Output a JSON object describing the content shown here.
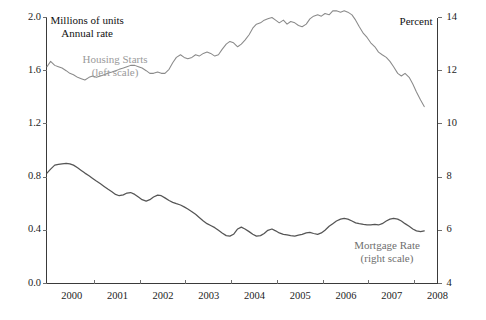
{
  "figure": {
    "background": "#ffffff",
    "left_unit_line1": "Millions of units",
    "left_unit_line2": "Annual rate",
    "right_unit": "Percent"
  },
  "annotations": {
    "housing_label_line1": "Housing Starts",
    "housing_label_line2": "(left scale)",
    "mortgage_label_line1": "Mortgage Rate",
    "mortgage_label_line2": "(right scale)"
  },
  "axes": {
    "left_ticks": [
      "0.0",
      "0.4",
      "0.8",
      "1.2",
      "1.6",
      "2.0"
    ],
    "left_tick_values": [
      0.0,
      0.4,
      0.8,
      1.2,
      1.6,
      2.0
    ],
    "right_ticks": [
      "4",
      "6",
      "8",
      "10",
      "12",
      "14"
    ],
    "right_tick_values": [
      4,
      6,
      8,
      10,
      12,
      14
    ],
    "x_ticks": [
      "2000",
      "2001",
      "2002",
      "2003",
      "2004",
      "2005",
      "2006",
      "2007",
      "2008"
    ],
    "x_tick_values": [
      2000,
      2001,
      2002,
      2003,
      2004,
      2005,
      2006,
      2007,
      2008
    ]
  },
  "chart_data": {
    "type": "line",
    "title": "",
    "subtitle": "",
    "xlabel": "",
    "ylabel": "Millions of units, Annual rate",
    "y2label": "Percent",
    "xlim": [
      1999.45,
      2008.0
    ],
    "ylim": [
      0.0,
      2.0
    ],
    "y2lim": [
      4,
      14
    ],
    "grid": false,
    "legend": "inline-annotations",
    "x_tick_labels": [
      "2000",
      "2001",
      "2002",
      "2003",
      "2004",
      "2005",
      "2006",
      "2007",
      "2008"
    ],
    "series": [
      {
        "name": "Housing Starts",
        "axis": "left",
        "scale_note": "left scale",
        "color": "#8a8a8a",
        "units": "Millions of units, annual rate",
        "x": [
          1999.46,
          1999.54,
          1999.63,
          1999.71,
          1999.79,
          1999.88,
          1999.96,
          2000.04,
          2000.13,
          2000.21,
          2000.29,
          2000.38,
          2000.46,
          2000.54,
          2000.63,
          2000.71,
          2000.79,
          2000.88,
          2000.96,
          2001.04,
          2001.13,
          2001.21,
          2001.29,
          2001.38,
          2001.46,
          2001.54,
          2001.63,
          2001.71,
          2001.79,
          2001.88,
          2001.96,
          2002.04,
          2002.13,
          2002.21,
          2002.29,
          2002.38,
          2002.46,
          2002.54,
          2002.63,
          2002.71,
          2002.79,
          2002.88,
          2002.96,
          2003.04,
          2003.13,
          2003.21,
          2003.29,
          2003.38,
          2003.46,
          2003.54,
          2003.63,
          2003.71,
          2003.79,
          2003.88,
          2003.96,
          2004.04,
          2004.13,
          2004.21,
          2004.29,
          2004.38,
          2004.46,
          2004.54,
          2004.63,
          2004.71,
          2004.79,
          2004.88,
          2004.96,
          2005.04,
          2005.13,
          2005.21,
          2005.29,
          2005.38,
          2005.46,
          2005.54,
          2005.63,
          2005.71,
          2005.79,
          2005.88,
          2005.96,
          2006.04,
          2006.13,
          2006.21,
          2006.29,
          2006.38,
          2006.46,
          2006.54,
          2006.63,
          2006.71,
          2006.79,
          2006.88,
          2006.96,
          2007.04,
          2007.13,
          2007.21,
          2007.29,
          2007.38,
          2007.46,
          2007.54,
          2007.63,
          2007.71
        ],
        "y": [
          1.63,
          1.67,
          1.64,
          1.63,
          1.62,
          1.6,
          1.58,
          1.57,
          1.55,
          1.54,
          1.53,
          1.55,
          1.56,
          1.55,
          1.56,
          1.57,
          1.58,
          1.59,
          1.6,
          1.61,
          1.62,
          1.63,
          1.64,
          1.64,
          1.63,
          1.62,
          1.6,
          1.58,
          1.58,
          1.59,
          1.58,
          1.58,
          1.61,
          1.66,
          1.7,
          1.72,
          1.7,
          1.69,
          1.7,
          1.72,
          1.71,
          1.73,
          1.74,
          1.73,
          1.71,
          1.72,
          1.76,
          1.8,
          1.82,
          1.81,
          1.78,
          1.8,
          1.83,
          1.87,
          1.92,
          1.95,
          1.96,
          1.98,
          1.99,
          2.0,
          1.98,
          1.96,
          1.98,
          1.95,
          1.97,
          1.96,
          1.94,
          1.93,
          1.95,
          1.99,
          2.01,
          2.02,
          2.01,
          2.03,
          2.02,
          2.05,
          2.05,
          2.04,
          2.05,
          2.04,
          2.02,
          1.98,
          1.93,
          1.88,
          1.85,
          1.81,
          1.78,
          1.74,
          1.72,
          1.7,
          1.67,
          1.63,
          1.58,
          1.56,
          1.58,
          1.55,
          1.5,
          1.44,
          1.38,
          1.33
        ]
      },
      {
        "name": "Mortgage Rate",
        "axis": "right",
        "scale_note": "right scale",
        "color": "#555555",
        "units": "Percent",
        "x": [
          1999.46,
          1999.54,
          1999.63,
          1999.71,
          1999.79,
          1999.88,
          1999.96,
          2000.04,
          2000.13,
          2000.21,
          2000.29,
          2000.38,
          2000.46,
          2000.54,
          2000.63,
          2000.71,
          2000.79,
          2000.88,
          2000.96,
          2001.04,
          2001.13,
          2001.21,
          2001.29,
          2001.38,
          2001.46,
          2001.54,
          2001.63,
          2001.71,
          2001.79,
          2001.88,
          2001.96,
          2002.04,
          2002.13,
          2002.21,
          2002.29,
          2002.38,
          2002.46,
          2002.54,
          2002.63,
          2002.71,
          2002.79,
          2002.88,
          2002.96,
          2003.04,
          2003.13,
          2003.21,
          2003.29,
          2003.38,
          2003.46,
          2003.54,
          2003.63,
          2003.71,
          2003.79,
          2003.88,
          2003.96,
          2004.04,
          2004.13,
          2004.21,
          2004.29,
          2004.38,
          2004.46,
          2004.54,
          2004.63,
          2004.71,
          2004.79,
          2004.88,
          2004.96,
          2005.04,
          2005.13,
          2005.21,
          2005.29,
          2005.38,
          2005.46,
          2005.54,
          2005.63,
          2005.71,
          2005.79,
          2005.88,
          2005.96,
          2006.04,
          2006.13,
          2006.21,
          2006.29,
          2006.38,
          2006.46,
          2006.54,
          2006.63,
          2006.71,
          2006.79,
          2006.88,
          2006.96,
          2007.04,
          2007.13,
          2007.21,
          2007.29,
          2007.38,
          2007.46,
          2007.54,
          2007.63,
          2007.71
        ],
        "y": [
          8.15,
          8.3,
          8.45,
          8.48,
          8.5,
          8.52,
          8.5,
          8.45,
          8.35,
          8.25,
          8.15,
          8.05,
          7.95,
          7.85,
          7.75,
          7.65,
          7.55,
          7.45,
          7.35,
          7.3,
          7.33,
          7.4,
          7.42,
          7.35,
          7.25,
          7.15,
          7.1,
          7.15,
          7.25,
          7.32,
          7.3,
          7.22,
          7.12,
          7.05,
          7.0,
          6.95,
          6.88,
          6.8,
          6.7,
          6.6,
          6.48,
          6.35,
          6.25,
          6.18,
          6.1,
          6.0,
          5.9,
          5.8,
          5.78,
          5.85,
          6.05,
          6.12,
          6.05,
          5.95,
          5.85,
          5.78,
          5.8,
          5.88,
          6.0,
          6.05,
          5.98,
          5.9,
          5.85,
          5.83,
          5.8,
          5.78,
          5.82,
          5.85,
          5.9,
          5.92,
          5.88,
          5.85,
          5.9,
          6.0,
          6.15,
          6.25,
          6.35,
          6.42,
          6.45,
          6.42,
          6.35,
          6.28,
          6.25,
          6.22,
          6.2,
          6.2,
          6.22,
          6.2,
          6.25,
          6.35,
          6.42,
          6.45,
          6.42,
          6.35,
          6.25,
          6.15,
          6.05,
          5.98,
          5.95,
          5.98
        ]
      }
    ]
  }
}
